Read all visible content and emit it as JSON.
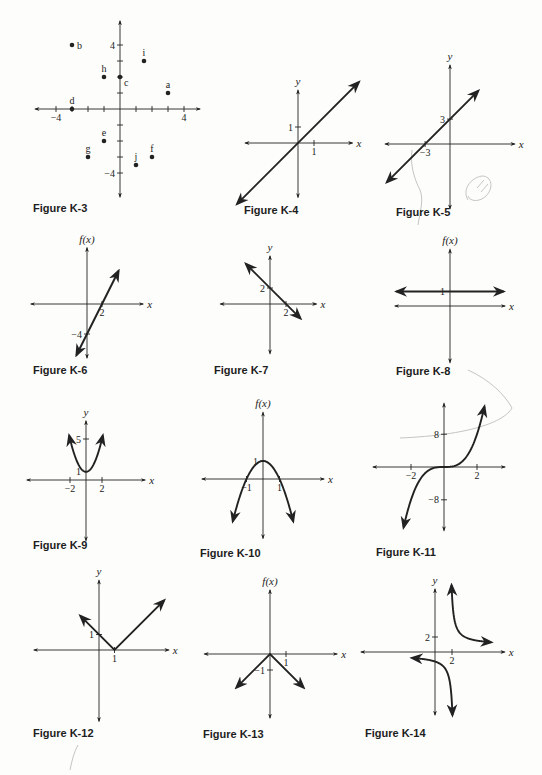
{
  "page": {
    "background": "#fdfdfb",
    "ink": "#222222",
    "pencil": "#b8b8b8"
  },
  "figures": [
    {
      "id": "K-3",
      "caption": "Figure K-3",
      "caption_pos": [
        33,
        202
      ],
      "origin": [
        120,
        109
      ],
      "scale": [
        16,
        16
      ],
      "x_extent": [
        -5.3,
        5.0
      ],
      "y_extent": [
        -5.5,
        5.5
      ],
      "x_label": "",
      "y_label": "",
      "ticks_x": [
        -4,
        -3,
        -2,
        -1,
        1,
        2,
        3,
        4
      ],
      "ticks_y": [
        -4,
        -3,
        -2,
        -1,
        1,
        2,
        3,
        4
      ],
      "tick_labels": [
        {
          "axis": "x",
          "value": -4,
          "text": "−4"
        },
        {
          "axis": "x",
          "value": 4,
          "text": "4"
        },
        {
          "axis": "y",
          "value": 4,
          "text": "4"
        },
        {
          "axis": "y",
          "value": -4,
          "text": "−4"
        }
      ],
      "points": [
        {
          "label": "a",
          "x": 3,
          "y": 1
        },
        {
          "label": "b",
          "x": -3,
          "y": 4
        },
        {
          "label": "c",
          "x": 0,
          "y": 2
        },
        {
          "label": "d",
          "x": -3,
          "y": 0
        },
        {
          "label": "e",
          "x": -1,
          "y": -2
        },
        {
          "label": "f",
          "x": 2,
          "y": -3
        },
        {
          "label": "g",
          "x": -2,
          "y": -3
        },
        {
          "label": "h",
          "x": -1,
          "y": 2
        },
        {
          "label": "i",
          "x": 1.5,
          "y": 3
        },
        {
          "label": "j",
          "x": 1,
          "y": -3.5
        }
      ],
      "curves": []
    },
    {
      "id": "K-4",
      "caption": "Figure K-4",
      "caption_pos": [
        244,
        204
      ],
      "origin": [
        298,
        143
      ],
      "scale": [
        16,
        16
      ],
      "x_extent": [
        -3.3,
        3.4
      ],
      "y_extent": [
        -3.4,
        3.3
      ],
      "x_label": "x",
      "y_label": "y",
      "ticks_x": [
        1
      ],
      "ticks_y": [
        1
      ],
      "tick_labels": [
        {
          "axis": "x",
          "value": 1,
          "text": "1"
        },
        {
          "axis": "y",
          "value": 1,
          "text": "1"
        }
      ],
      "points": [],
      "curves": [
        {
          "type": "line",
          "desc": "y = x",
          "from": [
            -3.8,
            -3.8
          ],
          "to": [
            3.8,
            3.8
          ],
          "arrows": "both"
        }
      ]
    },
    {
      "id": "K-5",
      "caption": "Figure K-5",
      "caption_pos": [
        396,
        206
      ],
      "origin": [
        450,
        144
      ],
      "scale": [
        8.3,
        8.3
      ],
      "x_extent": [
        -7.8,
        7.8
      ],
      "y_extent": [
        -7.8,
        9.5
      ],
      "x_label": "x",
      "y_label": "y",
      "ticks_x": [
        -3
      ],
      "ticks_y": [
        3
      ],
      "tick_labels": [
        {
          "axis": "x",
          "value": -3,
          "text": "−3"
        },
        {
          "axis": "y",
          "value": 3,
          "text": "3"
        }
      ],
      "points": [],
      "curves": [
        {
          "type": "line",
          "desc": "y = x + 3",
          "from": [
            -7.6,
            -4.6
          ],
          "to": [
            3.4,
            6.4
          ],
          "arrows": "both"
        }
      ]
    },
    {
      "id": "K-6",
      "caption": "Figure K-6",
      "caption_pos": [
        33,
        364
      ],
      "origin": [
        87,
        304
      ],
      "scale": [
        7.5,
        7.5
      ],
      "x_extent": [
        -7.5,
        7.5
      ],
      "y_extent": [
        -7.2,
        7.5
      ],
      "x_label": "x",
      "y_label": "f(x)",
      "ticks_x": [
        2
      ],
      "ticks_y": [
        -4
      ],
      "tick_labels": [
        {
          "axis": "x",
          "value": 2,
          "text": "2"
        },
        {
          "axis": "y",
          "value": -4,
          "text": "−4"
        }
      ],
      "points": [],
      "curves": [
        {
          "type": "line",
          "desc": "f(x) = 2x − 4",
          "from": [
            -1.4,
            -6.8
          ],
          "to": [
            4.2,
            4.4
          ],
          "arrows": "both"
        }
      ]
    },
    {
      "id": "K-7",
      "caption": "Figure K-7",
      "caption_pos": [
        214,
        364
      ],
      "origin": [
        270,
        304
      ],
      "scale": [
        8,
        8
      ],
      "x_extent": [
        -6.2,
        5.8
      ],
      "y_extent": [
        -6.2,
        6.0
      ],
      "x_label": "x",
      "y_label": "y",
      "ticks_x": [
        2
      ],
      "ticks_y": [
        2
      ],
      "tick_labels": [
        {
          "axis": "x",
          "value": 2,
          "text": "2"
        },
        {
          "axis": "y",
          "value": 2,
          "text": "2"
        }
      ],
      "points": [],
      "curves": [
        {
          "type": "line",
          "desc": "y = −x + 2",
          "from": [
            -3.0,
            5.0
          ],
          "to": [
            3.8,
            -1.8
          ],
          "arrows": "both"
        }
      ]
    },
    {
      "id": "K-8",
      "caption": "Figure K-8",
      "caption_pos": [
        396,
        365
      ],
      "origin": [
        450,
        306
      ],
      "scale": [
        14.5,
        14.5
      ],
      "x_extent": [
        -3.8,
        3.8
      ],
      "y_extent": [
        -3.9,
        3.9
      ],
      "x_label": "x",
      "y_label": "f(x)",
      "ticks_x": [],
      "ticks_y": [
        1
      ],
      "tick_labels": [
        {
          "axis": "y",
          "value": 1,
          "text": "1"
        }
      ],
      "points": [],
      "curves": [
        {
          "type": "line",
          "desc": "f(x) = 1",
          "from": [
            -3.7,
            1
          ],
          "to": [
            3.7,
            1
          ],
          "arrows": "both"
        }
      ]
    },
    {
      "id": "K-9",
      "caption": "Figure K-9",
      "caption_pos": [
        33,
        539
      ],
      "origin": [
        86,
        480
      ],
      "scale": [
        8,
        8.2
      ],
      "x_extent": [
        -7.4,
        7.4
      ],
      "y_extent": [
        -7.4,
        7.2
      ],
      "x_label": "x",
      "y_label": "y",
      "ticks_x": [
        -2,
        2
      ],
      "ticks_y": [
        5
      ],
      "tick_labels": [
        {
          "axis": "x",
          "value": -2,
          "text": "−2"
        },
        {
          "axis": "x",
          "value": 2,
          "text": "2"
        },
        {
          "axis": "y",
          "value": 5,
          "text": "5"
        },
        {
          "axis": "y",
          "value": 1,
          "text": "1"
        }
      ],
      "points": [],
      "curves": [
        {
          "type": "function",
          "desc": "y = x² + 1",
          "fn": "x*x+1",
          "domain": [
            -2.1,
            2.1
          ],
          "arrows": "both"
        }
      ]
    },
    {
      "id": "K-10",
      "caption": "Figure K-10",
      "caption_pos": [
        200,
        547
      ],
      "origin": [
        263,
        479
      ],
      "scale": [
        16.5,
        18
      ],
      "x_extent": [
        -3.7,
        3.7
      ],
      "y_extent": [
        -3.3,
        3.7
      ],
      "x_label": "x",
      "y_label": "f(x)",
      "ticks_x": [
        -1,
        1
      ],
      "ticks_y": [
        1
      ],
      "tick_labels": [
        {
          "axis": "x",
          "value": -1,
          "text": "−1"
        },
        {
          "axis": "x",
          "value": 1,
          "text": "1"
        },
        {
          "axis": "y",
          "value": 1,
          "text": "1"
        }
      ],
      "points": [],
      "curves": [
        {
          "type": "function",
          "desc": "f(x) = 1 − x²",
          "fn": "1-x*x",
          "domain": [
            -1.83,
            1.83
          ],
          "arrows": "both"
        }
      ]
    },
    {
      "id": "K-11",
      "caption": "Figure K-11",
      "caption_pos": [
        376,
        546
      ],
      "origin": [
        444,
        467
      ],
      "scale": [
        16.5,
        4.1
      ],
      "x_extent": [
        -4.3,
        3.7
      ],
      "y_extent": [
        -15.5,
        15.5
      ],
      "x_label": "",
      "y_label": "",
      "ticks_x": [
        -2,
        2
      ],
      "ticks_y": [
        8,
        -8
      ],
      "tick_labels": [
        {
          "axis": "x",
          "value": -2,
          "text": "−2"
        },
        {
          "axis": "x",
          "value": 2,
          "text": "2"
        },
        {
          "axis": "y",
          "value": 8,
          "text": "8"
        },
        {
          "axis": "y",
          "value": -8,
          "text": "−8"
        }
      ],
      "points": [],
      "curves": [
        {
          "type": "function",
          "desc": "y = x³",
          "fn": "x*x*x",
          "domain": [
            -2.45,
            2.45
          ],
          "arrows": "both"
        }
      ]
    },
    {
      "id": "K-12",
      "caption": "Figure K-12",
      "caption_pos": [
        33,
        727
      ],
      "origin": [
        99,
        650
      ],
      "scale": [
        15.5,
        15.5
      ],
      "x_extent": [
        -4.2,
        4.5
      ],
      "y_extent": [
        -4.6,
        4.5
      ],
      "x_label": "x",
      "y_label": "y",
      "ticks_x": [
        1
      ],
      "ticks_y": [
        1
      ],
      "tick_labels": [
        {
          "axis": "x",
          "value": 1,
          "text": "1"
        },
        {
          "axis": "y",
          "value": 1,
          "text": "1"
        }
      ],
      "points": [],
      "curves": [
        {
          "type": "polyline",
          "desc": "y = |x − 1|",
          "points": [
            [
              -1.2,
              2.2
            ],
            [
              1,
              0
            ],
            [
              4.2,
              3.2
            ]
          ],
          "arrows": "both"
        }
      ]
    },
    {
      "id": "K-13",
      "caption": "Figure K-13",
      "caption_pos": [
        203,
        728
      ],
      "origin": [
        270,
        654
      ],
      "scale": [
        16,
        16
      ],
      "x_extent": [
        -4.1,
        4.2
      ],
      "y_extent": [
        -4.0,
        4.0
      ],
      "x_label": "x",
      "y_label": "f(x)",
      "ticks_x": [
        1
      ],
      "ticks_y": [
        -1
      ],
      "tick_labels": [
        {
          "axis": "x",
          "value": 1,
          "text": "1"
        },
        {
          "axis": "y",
          "value": -1,
          "text": "−1"
        }
      ],
      "points": [],
      "curves": [
        {
          "type": "polyline",
          "desc": "f(x) = −|x|",
          "points": [
            [
              -2.1,
              -2.1
            ],
            [
              0,
              0
            ],
            [
              2.1,
              -2.1
            ]
          ],
          "arrows": "both"
        }
      ]
    },
    {
      "id": "K-14",
      "caption": "Figure K-14",
      "caption_pos": [
        365,
        727
      ],
      "origin": [
        435,
        652
      ],
      "scale": [
        8.5,
        7.5
      ],
      "x_extent": [
        -8.7,
        8.2
      ],
      "y_extent": [
        -8.4,
        8.4
      ],
      "x_label": "x",
      "y_label": "y",
      "ticks_x": [
        2
      ],
      "ticks_y": [
        2
      ],
      "tick_labels": [
        {
          "axis": "x",
          "value": 2,
          "text": "2"
        },
        {
          "axis": "y",
          "value": 2,
          "text": "2"
        }
      ],
      "points": [],
      "curves": [
        {
          "type": "function",
          "desc": "y = 1/x (x > 0 branch, shifted)",
          "fn": "2/(x-1.7)+0.9",
          "domain": [
            1.95,
            6.6
          ],
          "arrows": "both"
        },
        {
          "type": "function",
          "desc": "y = 1/x (x < 0 branch, shifted)",
          "fn": "2/(x-2.3)-0.4",
          "domain": [
            -2.7,
            2.05
          ],
          "arrows": "both"
        }
      ]
    }
  ],
  "chart_data": [
    {
      "type": "scatter",
      "title": "Figure K-3",
      "xlabel": "",
      "ylabel": "",
      "xlim": [
        -5,
        5
      ],
      "ylim": [
        -5,
        5
      ],
      "grid": false,
      "tick_labels": {
        "x": [
          "-4",
          "4"
        ],
        "y": [
          "4",
          "-4"
        ]
      },
      "points": [
        {
          "label": "a",
          "x": 3,
          "y": 1
        },
        {
          "label": "b",
          "x": -3,
          "y": 4
        },
        {
          "label": "c",
          "x": 0,
          "y": 2
        },
        {
          "label": "d",
          "x": -3,
          "y": 0
        },
        {
          "label": "e",
          "x": -1,
          "y": -2
        },
        {
          "label": "f",
          "x": 2,
          "y": -3
        },
        {
          "label": "g",
          "x": -2,
          "y": -3
        },
        {
          "label": "h",
          "x": -1,
          "y": 2
        },
        {
          "label": "i",
          "x": 1.5,
          "y": 3
        },
        {
          "label": "j",
          "x": 1,
          "y": -3.5
        }
      ]
    },
    {
      "type": "line",
      "title": "Figure K-4",
      "xlabel": "x",
      "ylabel": "y",
      "equation": "y = x",
      "intercepts": {
        "x": 0,
        "y": 0
      },
      "tick_labels": {
        "x": [
          "1"
        ],
        "y": [
          "1"
        ]
      }
    },
    {
      "type": "line",
      "title": "Figure K-5",
      "xlabel": "x",
      "ylabel": "y",
      "equation": "y = x + 3",
      "intercepts": {
        "x": -3,
        "y": 3
      },
      "tick_labels": {
        "x": [
          "-3"
        ],
        "y": [
          "3"
        ]
      }
    },
    {
      "type": "line",
      "title": "Figure K-6",
      "xlabel": "x",
      "ylabel": "f(x)",
      "equation": "f(x) = 2x - 4",
      "intercepts": {
        "x": 2,
        "y": -4
      },
      "tick_labels": {
        "x": [
          "2"
        ],
        "y": [
          "-4"
        ]
      }
    },
    {
      "type": "line",
      "title": "Figure K-7",
      "xlabel": "x",
      "ylabel": "y",
      "equation": "y = -x + 2",
      "intercepts": {
        "x": 2,
        "y": 2
      },
      "tick_labels": {
        "x": [
          "2"
        ],
        "y": [
          "2"
        ]
      }
    },
    {
      "type": "line",
      "title": "Figure K-8",
      "xlabel": "x",
      "ylabel": "f(x)",
      "equation": "f(x) = 1",
      "intercepts": {
        "y": 1
      },
      "tick_labels": {
        "y": [
          "1"
        ]
      }
    },
    {
      "type": "line",
      "title": "Figure K-9",
      "xlabel": "x",
      "ylabel": "y",
      "equation": "y = x^2 + 1",
      "vertex": [
        0,
        1
      ],
      "tick_labels": {
        "x": [
          "-2",
          "2"
        ],
        "y": [
          "5",
          "1"
        ]
      }
    },
    {
      "type": "line",
      "title": "Figure K-10",
      "xlabel": "x",
      "ylabel": "f(x)",
      "equation": "f(x) = 1 - x^2",
      "vertex": [
        0,
        1
      ],
      "x_intercepts": [
        -1,
        1
      ],
      "tick_labels": {
        "x": [
          "-1",
          "1"
        ],
        "y": [
          "1"
        ]
      }
    },
    {
      "type": "line",
      "title": "Figure K-11",
      "xlabel": "",
      "ylabel": "",
      "equation": "y = x^3",
      "tick_labels": {
        "x": [
          "-2",
          "2"
        ],
        "y": [
          "8",
          "-8"
        ]
      }
    },
    {
      "type": "line",
      "title": "Figure K-12",
      "xlabel": "x",
      "ylabel": "y",
      "equation": "y = |x - 1|",
      "vertex": [
        1,
        0
      ],
      "y_intercept": 1,
      "tick_labels": {
        "x": [
          "1"
        ],
        "y": [
          "1"
        ]
      }
    },
    {
      "type": "line",
      "title": "Figure K-13",
      "xlabel": "x",
      "ylabel": "f(x)",
      "equation": "f(x) = -|x|",
      "vertex": [
        0,
        0
      ],
      "tick_labels": {
        "x": [
          "1"
        ],
        "y": [
          "-1"
        ]
      }
    },
    {
      "type": "line",
      "title": "Figure K-14",
      "xlabel": "x",
      "ylabel": "y",
      "equation": "hyperbola branches (rational function, vertical asymptote near x = 2)",
      "tick_labels": {
        "x": [
          "2"
        ],
        "y": [
          "2"
        ]
      }
    }
  ],
  "annotations": {
    "pencil_marks": [
      {
        "desc": "circled scribble near Figure K-5",
        "cx": 478,
        "cy": 190
      },
      {
        "desc": "pencil stroke below Figure K-5 x-intercept",
        "x": 415,
        "y": 150
      },
      {
        "desc": "pencil arc from Figure K-8 through Figure K-11",
        "x": 480,
        "y": 380
      }
    ]
  }
}
